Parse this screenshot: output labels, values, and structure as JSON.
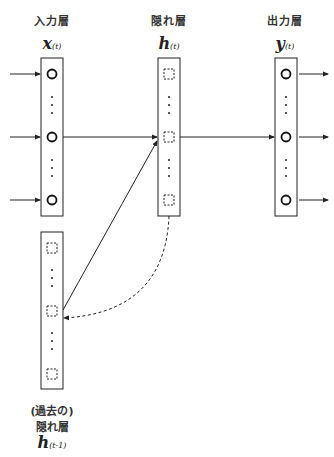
{
  "layers": {
    "input": {
      "title": "入力層",
      "symbol": "x",
      "subscript": "(t)"
    },
    "hidden": {
      "title": "隠れ層",
      "symbol": "h",
      "subscript": "(t)"
    },
    "output": {
      "title": "出力層",
      "symbol": "y",
      "subscript": "(t)"
    },
    "past_hidden": {
      "title_line1": "(過去の)",
      "title_line2": "隠れ層",
      "symbol": "h",
      "subscript": "(t-1)"
    }
  },
  "node_shapes": {
    "input": "circle",
    "output": "circle",
    "hidden": "dashed-square",
    "past_hidden": "dashed-square"
  },
  "connections": [
    {
      "from": "external",
      "to": "input",
      "style": "solid-arrow",
      "count": 3
    },
    {
      "from": "input",
      "to": "hidden",
      "style": "solid-arrow"
    },
    {
      "from": "hidden",
      "to": "output",
      "style": "solid-arrow"
    },
    {
      "from": "output",
      "to": "external",
      "style": "solid-arrow",
      "count": 3
    },
    {
      "from": "past_hidden",
      "to": "hidden",
      "style": "solid-arrow"
    },
    {
      "from": "hidden",
      "to": "past_hidden",
      "style": "dashed-curved-arrow"
    }
  ],
  "colors": {
    "stroke": "#222222",
    "text": "#333333"
  }
}
